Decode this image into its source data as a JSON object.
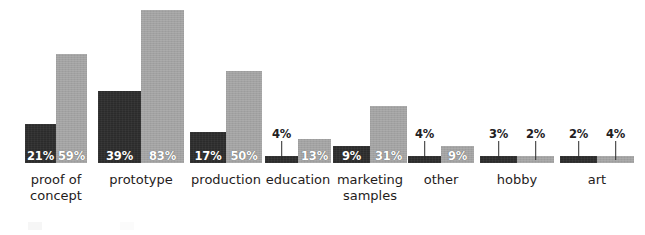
{
  "chart_data": {
    "type": "bar",
    "title": "",
    "subtitle": "",
    "xlabel": "",
    "ylabel": "",
    "ylim": [
      0,
      90
    ],
    "grid": false,
    "legend_position": "bottom-left",
    "value_suffix": "%",
    "categories": [
      "proof of concept",
      "prototype",
      "production",
      "education",
      "marketing samples",
      "other",
      "hobby",
      "art"
    ],
    "series": [
      {
        "name": "dark",
        "color": "#2b2b2b",
        "values": [
          21,
          39,
          17,
          4,
          9,
          4,
          3,
          2
        ]
      },
      {
        "name": "light",
        "color": "#a2a2a2",
        "values": [
          59,
          83,
          50,
          13,
          31,
          9,
          2,
          4
        ]
      }
    ]
  },
  "colors": {
    "dark_bar": "#2b2b2b",
    "light_bar": "#a2a2a2",
    "inside_label": "#ffffff",
    "outside_label": "#23201e",
    "category_label": "#1f1c1b",
    "background": "#ffffff"
  },
  "groups": [
    {
      "label_line1": "proof of",
      "label_line2": "concept",
      "bars": [
        {
          "value_text": "21%",
          "series": "dark",
          "label_mode": "inside"
        },
        {
          "value_text": "59%",
          "series": "light",
          "label_mode": "inside"
        }
      ]
    },
    {
      "label_line1": "prototype",
      "label_line2": "",
      "bars": [
        {
          "value_text": "39%",
          "series": "dark",
          "label_mode": "inside"
        },
        {
          "value_text": "83%",
          "series": "light",
          "label_mode": "inside"
        }
      ]
    },
    {
      "label_line1": "production",
      "label_line2": "",
      "bars": [
        {
          "value_text": "17%",
          "series": "dark",
          "label_mode": "inside"
        },
        {
          "value_text": "50%",
          "series": "light",
          "label_mode": "inside"
        }
      ]
    },
    {
      "label_line1": "education",
      "label_line2": "",
      "bars": [
        {
          "value_text": "4%",
          "series": "dark",
          "label_mode": "outside"
        },
        {
          "value_text": "13%",
          "series": "light",
          "label_mode": "inside"
        }
      ]
    },
    {
      "label_line1": "marketing",
      "label_line2": "samples",
      "bars": [
        {
          "value_text": "9%",
          "series": "dark",
          "label_mode": "inside"
        },
        {
          "value_text": "31%",
          "series": "light",
          "label_mode": "inside"
        }
      ]
    },
    {
      "label_line1": "other",
      "label_line2": "",
      "bars": [
        {
          "value_text": "4%",
          "series": "dark",
          "label_mode": "outside"
        },
        {
          "value_text": "9%",
          "series": "light",
          "label_mode": "inside"
        }
      ]
    },
    {
      "label_line1": "hobby",
      "label_line2": "",
      "bars": [
        {
          "value_text": "3%",
          "series": "dark",
          "label_mode": "outside"
        },
        {
          "value_text": "2%",
          "series": "light",
          "label_mode": "outside"
        }
      ]
    },
    {
      "label_line1": "art",
      "label_line2": "",
      "bars": [
        {
          "value_text": "2%",
          "series": "dark",
          "label_mode": "outside"
        },
        {
          "value_text": "4%",
          "series": "light",
          "label_mode": "outside"
        }
      ]
    }
  ],
  "legend": {
    "entries": [
      {
        "swatch": "dark",
        "text": ""
      },
      {
        "swatch": "light",
        "text": ""
      }
    ]
  }
}
